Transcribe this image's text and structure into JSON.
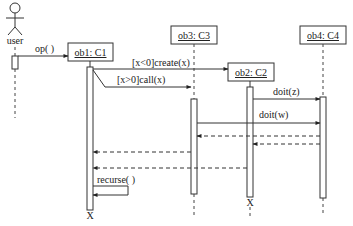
{
  "diagram": {
    "type": "uml-sequence",
    "actor": {
      "label": "user"
    },
    "objects": [
      {
        "id": "ob1",
        "label": "ob1: C1"
      },
      {
        "id": "ob3",
        "label": "ob3: C3"
      },
      {
        "id": "ob2",
        "label": "ob2: C2"
      },
      {
        "id": "ob4",
        "label": "ob4: C4"
      }
    ],
    "messages": [
      {
        "from": "user",
        "to": "ob1",
        "label": "op( )",
        "kind": "sync"
      },
      {
        "from": "ob1",
        "to": "ob2",
        "label": "[x<0]create(x)",
        "kind": "create"
      },
      {
        "from": "ob1",
        "to": "ob3",
        "label": "[x>0]call(x)",
        "kind": "sync"
      },
      {
        "from": "ob2",
        "to": "ob4",
        "label": "doit(z)",
        "kind": "sync"
      },
      {
        "from": "ob3",
        "to": "ob4",
        "label": "doit(w)",
        "kind": "sync"
      },
      {
        "from": "ob4",
        "to": "ob3",
        "label": "",
        "kind": "return"
      },
      {
        "from": "ob4",
        "to": "ob2",
        "label": "",
        "kind": "return"
      },
      {
        "from": "ob3",
        "to": "ob1",
        "label": "",
        "kind": "return"
      },
      {
        "from": "ob2",
        "to": "ob1",
        "label": "",
        "kind": "return"
      },
      {
        "from": "ob1",
        "to": "ob1",
        "label": "recurse( )",
        "kind": "self"
      }
    ],
    "destroy_marker": "X",
    "destroyed": [
      "ob1",
      "ob2"
    ]
  }
}
